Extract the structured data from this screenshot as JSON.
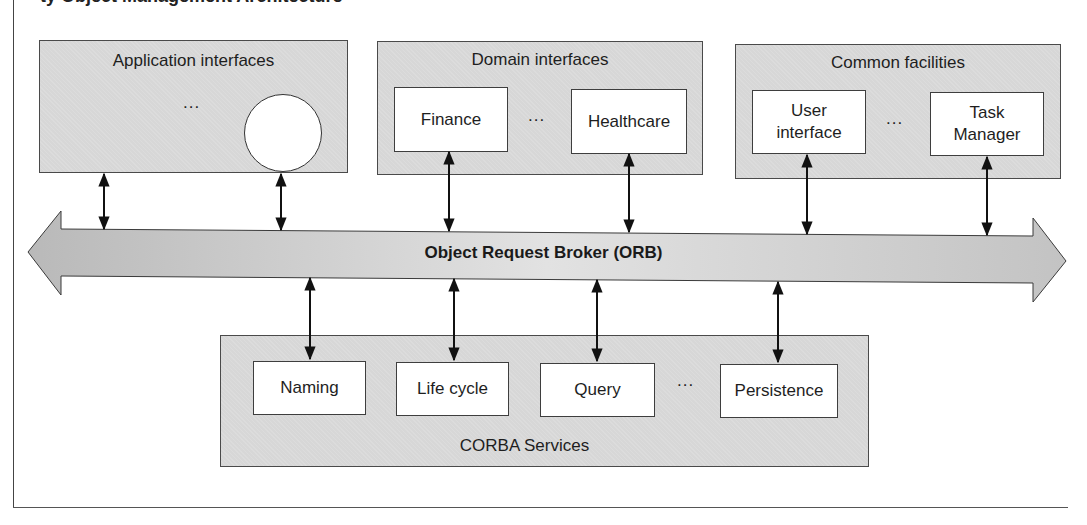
{
  "title_partial": "ty Object Management Architecture",
  "orb": {
    "label": "Object Request Broker (ORB)",
    "fill_left": "#b9b9b9",
    "fill_mid": "#e2e2e2",
    "fill_right": "#c3c3c3"
  },
  "groups": {
    "application": {
      "label": "Application interfaces",
      "ellipsis": "...",
      "items": []
    },
    "domain": {
      "label": "Domain interfaces",
      "ellipsis": "...",
      "items": [
        "Finance",
        "Healthcare"
      ]
    },
    "common": {
      "label": "Common facilities",
      "ellipsis": "...",
      "items": [
        "User interface",
        "Task Manager"
      ]
    },
    "services": {
      "label": "CORBA Services",
      "ellipsis": "...",
      "items": [
        "Naming",
        "Life cycle",
        "Query",
        "Persistence"
      ]
    }
  },
  "colors": {
    "group_fill": "#d7d7d7",
    "box_fill": "#ffffff",
    "stroke": "#3e3e3e"
  }
}
